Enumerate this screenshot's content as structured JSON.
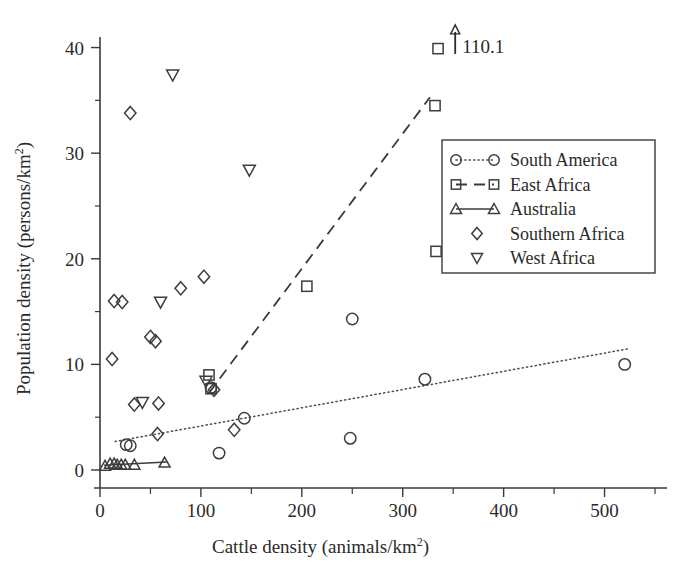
{
  "chart_data": {
    "type": "scatter",
    "title": "",
    "xlabel": "Cattle density (animals/km2)",
    "xlabel_base": "Cattle density (animals/km",
    "xlabel_sup": "2",
    "xlabel_tail": ")",
    "ylabel": "Population density (persons/km2)",
    "ylabel_base": "Population density (persons/km",
    "ylabel_sup": "2",
    "ylabel_tail": ")",
    "xlim": [
      0,
      550
    ],
    "ylim": [
      0,
      41
    ],
    "xticks": [
      0,
      100,
      200,
      300,
      400,
      500
    ],
    "xtick_labels": [
      "0",
      "100",
      "200",
      "300",
      "400",
      "500"
    ],
    "xticks_minor": [
      50,
      150,
      250,
      350,
      450,
      550
    ],
    "yticks": [
      0,
      10,
      20,
      30,
      40
    ],
    "ytick_labels": [
      "0",
      "10",
      "20",
      "30",
      "40"
    ],
    "yticks_minor": [
      5,
      15,
      25,
      35
    ],
    "grid": false,
    "legend_position": "center-right",
    "marker_color": "#3d3d3d",
    "axis_color": "#3a3a3a",
    "text_color": "#2b2b2b",
    "background": "#ffffff",
    "annotations": [
      {
        "name": "off-scale-arrow",
        "text": "110.1",
        "x": 352,
        "y": 39.4,
        "arrow": "up"
      }
    ],
    "series": [
      {
        "name": "South America",
        "marker": "circle",
        "line": "dotted",
        "points": [
          [
            26,
            2.4
          ],
          [
            30,
            2.3
          ],
          [
            110,
            7.8
          ],
          [
            143,
            4.9
          ],
          [
            118,
            1.6
          ],
          [
            250,
            14.3
          ],
          [
            248,
            3.0
          ],
          [
            322,
            8.6
          ],
          [
            520,
            10.0
          ]
        ],
        "fit_line": [
          [
            15,
            2.7
          ],
          [
            525,
            11.5
          ]
        ]
      },
      {
        "name": "East Africa",
        "marker": "square",
        "line": "dashed",
        "points": [
          [
            108,
            9.0
          ],
          [
            110,
            7.7
          ],
          [
            205,
            17.4
          ],
          [
            332,
            34.5
          ],
          [
            335,
            39.9
          ],
          [
            333,
            20.7
          ]
        ],
        "fit_line": [
          [
            108,
            7.3
          ],
          [
            327,
            35.3
          ]
        ]
      },
      {
        "name": "Australia",
        "marker": "triangle-up",
        "line": "solid",
        "points": [
          [
            5,
            0.4
          ],
          [
            10,
            0.6
          ],
          [
            14,
            0.6
          ],
          [
            17,
            0.5
          ],
          [
            21,
            0.5
          ],
          [
            25,
            0.5
          ],
          [
            34,
            0.5
          ],
          [
            64,
            0.7
          ]
        ],
        "fit_line": [
          [
            4,
            0.45
          ],
          [
            66,
            0.75
          ]
        ]
      },
      {
        "name": "Southern Africa",
        "marker": "diamond",
        "line": "none",
        "points": [
          [
            30,
            33.8
          ],
          [
            14,
            16.0
          ],
          [
            22,
            15.9
          ],
          [
            80,
            17.2
          ],
          [
            103,
            18.3
          ],
          [
            50,
            12.6
          ],
          [
            55,
            12.2
          ],
          [
            12,
            10.5
          ],
          [
            34,
            6.2
          ],
          [
            58,
            6.3
          ],
          [
            57,
            3.4
          ],
          [
            113,
            7.6
          ],
          [
            133,
            3.8
          ]
        ],
        "fit_line": null
      },
      {
        "name": "West Africa",
        "marker": "triangle-down",
        "line": "none",
        "points": [
          [
            72,
            37.4
          ],
          [
            148,
            28.4
          ],
          [
            60,
            15.9
          ],
          [
            105,
            8.4
          ],
          [
            42,
            6.4
          ]
        ],
        "fit_line": null
      }
    ]
  },
  "legend": {
    "entries": [
      {
        "label": "South America",
        "marker": "circle",
        "line": "dotted"
      },
      {
        "label": "East Africa",
        "marker": "square",
        "line": "dashed"
      },
      {
        "label": "Australia",
        "marker": "triangle-up",
        "line": "solid"
      },
      {
        "label": "Southern Africa",
        "marker": "diamond",
        "line": "none"
      },
      {
        "label": "West Africa",
        "marker": "triangle-down",
        "line": "none"
      }
    ]
  }
}
